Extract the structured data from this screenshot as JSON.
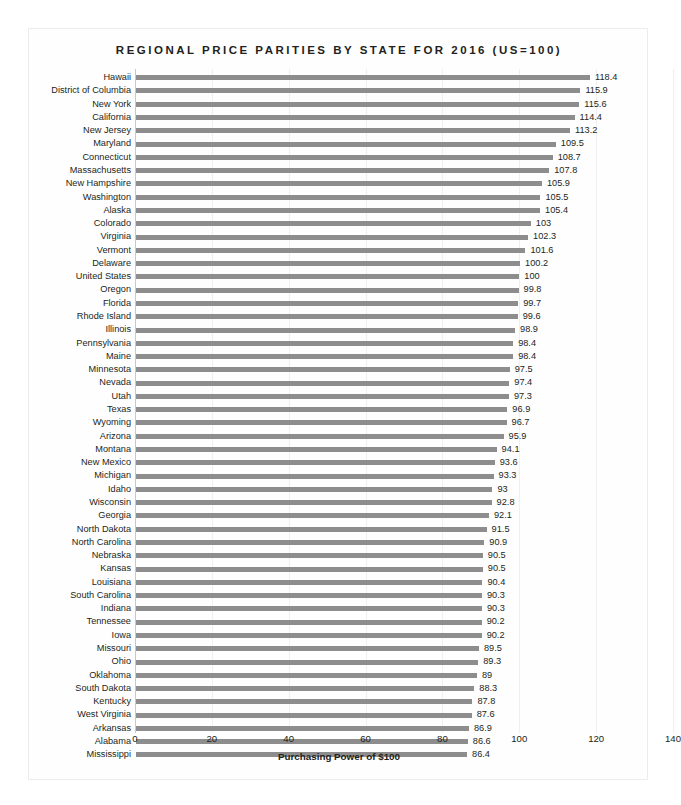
{
  "chart_data": {
    "type": "bar",
    "orientation": "horizontal",
    "title": "REGIONAL PRICE PARITIES BY STATE FOR 2016 (US=100)",
    "xlabel": "Purchasing Power of $100",
    "ylabel": "",
    "xlim": [
      0,
      140
    ],
    "xticks": [
      0,
      20,
      40,
      60,
      80,
      100,
      120,
      140
    ],
    "grid": true,
    "legend": false,
    "bar_color": "#8d8d8d",
    "categories": [
      "Hawaii",
      "District of Columbia",
      "New York",
      "California",
      "New Jersey",
      "Maryland",
      "Connecticut",
      "Massachusetts",
      "New Hampshire",
      "Washington",
      "Alaska",
      "Colorado",
      "Virginia",
      "Vermont",
      "Delaware",
      "United States",
      "Oregon",
      "Florida",
      "Rhode Island",
      "Illinois",
      "Pennsylvania",
      "Maine",
      "Minnesota",
      "Nevada",
      "Utah",
      "Texas",
      "Wyoming",
      "Arizona",
      "Montana",
      "New Mexico",
      "Michigan",
      "Idaho",
      "Wisconsin",
      "Georgia",
      "North Dakota",
      "North Carolina",
      "Nebraska",
      "Kansas",
      "Louisiana",
      "South Carolina",
      "Indiana",
      "Tennessee",
      "Iowa",
      "Missouri",
      "Ohio",
      "Oklahoma",
      "South Dakota",
      "Kentucky",
      "West Virginia",
      "Arkansas",
      "Alabama",
      "Mississippi"
    ],
    "values": [
      118.4,
      115.9,
      115.6,
      114.4,
      113.2,
      109.5,
      108.7,
      107.8,
      105.9,
      105.5,
      105.4,
      103,
      102.3,
      101.6,
      100.2,
      100,
      99.8,
      99.7,
      99.6,
      98.9,
      98.4,
      98.4,
      97.5,
      97.4,
      97.3,
      96.9,
      96.7,
      95.9,
      94.1,
      93.6,
      93.3,
      93,
      92.8,
      92.1,
      91.5,
      90.9,
      90.5,
      90.5,
      90.4,
      90.3,
      90.3,
      90.2,
      90.2,
      89.5,
      89.3,
      89,
      88.3,
      87.8,
      87.6,
      86.9,
      86.6,
      86.4
    ],
    "value_labels": [
      "118.4",
      "115.9",
      "115.6",
      "114.4",
      "113.2",
      "109.5",
      "108.7",
      "107.8",
      "105.9",
      "105.5",
      "105.4",
      "103",
      "102.3",
      "101.6",
      "100.2",
      "100",
      "99.8",
      "99.7",
      "99.6",
      "98.9",
      "98.4",
      "98.4",
      "97.5",
      "97.4",
      "97.3",
      "96.9",
      "96.7",
      "95.9",
      "94.1",
      "93.6",
      "93.3",
      "93",
      "92.8",
      "92.1",
      "91.5",
      "90.9",
      "90.5",
      "90.5",
      "90.4",
      "90.3",
      "90.3",
      "90.2",
      "90.2",
      "89.5",
      "89.3",
      "89",
      "88.3",
      "87.8",
      "87.6",
      "86.9",
      "86.6",
      "86.4"
    ]
  },
  "page": {
    "caption": ""
  }
}
